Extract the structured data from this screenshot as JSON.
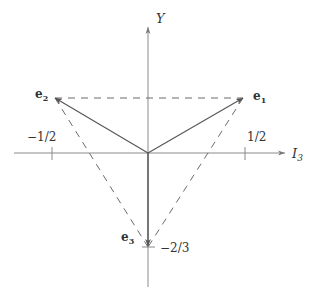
{
  "diagram": {
    "colors": {
      "line": "#6b6b6b",
      "axis": "#8a8a8a",
      "text": "#333333",
      "background": "#ffffff"
    },
    "axes": {
      "x_label_main": "I",
      "x_label_sub": "3",
      "y_label": "Y"
    },
    "ticks": {
      "x_neg": "−1/2",
      "x_pos": "1/2",
      "y_neg": "−2/3"
    },
    "vectors": [
      {
        "name": "e",
        "sub": "1",
        "i3": "1/2",
        "y": "1/3"
      },
      {
        "name": "e",
        "sub": "2",
        "i3": "-1/2",
        "y": "1/3"
      },
      {
        "name": "e",
        "sub": "3",
        "i3": "0",
        "y": "-2/3"
      }
    ],
    "triangle": {
      "style": "dashed",
      "vertices": [
        "e1",
        "e2",
        "e3"
      ]
    }
  }
}
